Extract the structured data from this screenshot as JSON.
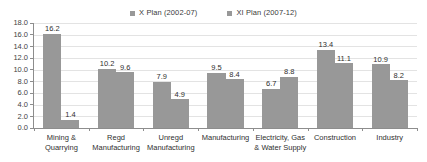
{
  "chart_data": {
    "type": "bar",
    "title": "",
    "subtitle": "",
    "xlabel": "",
    "ylabel": "",
    "ylim": [
      0.0,
      18.0
    ],
    "ytick_labels": [
      "18.0",
      "16.0",
      "14.0",
      "12.0",
      "10.0",
      "8.0",
      "6.0",
      "4.0",
      "2.0",
      "0.0"
    ],
    "ytick_values": [
      18.0,
      16.0,
      14.0,
      12.0,
      10.0,
      8.0,
      6.0,
      4.0,
      2.0,
      0.0
    ],
    "grid": true,
    "legend_position": "top-center",
    "categories": [
      "Mining & Quarrying",
      "Regd Manufacturing",
      "Unregd Manufacturing",
      "Manufacturing",
      "Electricity, Gas & Water Supply",
      "Construction",
      "Industry"
    ],
    "category_lines": [
      [
        "Mining &",
        "Quarrying"
      ],
      [
        "Regd",
        "Manufacturing"
      ],
      [
        "Unregd",
        "Manufacturing"
      ],
      [
        "Manufacturing"
      ],
      [
        "Electricity, Gas",
        "& Water Supply"
      ],
      [
        "Construction"
      ],
      [
        "Industry"
      ]
    ],
    "series": [
      {
        "name": "X Plan (2002-07)",
        "color": "#989898",
        "values": [
          16.2,
          10.2,
          7.9,
          9.5,
          6.7,
          13.4,
          10.9
        ],
        "labels": [
          "16.2",
          "10.2",
          "7.9",
          "9.5",
          "6.7",
          "13.4",
          "10.9"
        ]
      },
      {
        "name": "XI Plan (2007-12)",
        "color": "#989898",
        "values": [
          1.4,
          9.6,
          4.9,
          8.4,
          8.8,
          11.1,
          8.2
        ],
        "labels": [
          "1.4",
          "9.6",
          "4.9",
          "8.4",
          "8.8",
          "11.1",
          "8.2"
        ]
      }
    ]
  },
  "legend": {
    "items": [
      {
        "label": "X Plan (2002-07)",
        "color": "#989898"
      },
      {
        "label": "XI Plan (2007-12)",
        "color": "#989898"
      }
    ]
  },
  "colors": {
    "bar": "#989898",
    "gridline": "#e3e3e3",
    "axis": "#8d8d8d",
    "text": "#2f2f2f",
    "background": "#ffffff"
  }
}
